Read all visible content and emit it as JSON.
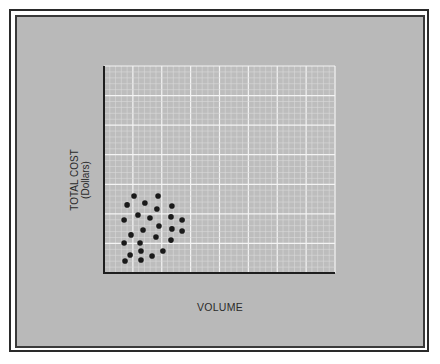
{
  "chart_data": {
    "type": "scatter",
    "title": "",
    "xlabel": "VOLUME",
    "ylabel": "TOTAL COST",
    "ylabel_sub": "(Dollars)",
    "xlim": [
      0,
      100
    ],
    "ylim": [
      0,
      100
    ],
    "grid": true,
    "ticks_labeled": false,
    "legend": "none",
    "marker_color": "#1a1a1a",
    "series": [
      {
        "name": "observations",
        "points": [
          {
            "x": 13.0,
            "y": 37.2
          },
          {
            "x": 23.4,
            "y": 37.2
          },
          {
            "x": 10.0,
            "y": 32.9
          },
          {
            "x": 17.7,
            "y": 33.8
          },
          {
            "x": 22.9,
            "y": 30.9
          },
          {
            "x": 29.4,
            "y": 32.4
          },
          {
            "x": 14.7,
            "y": 28.0
          },
          {
            "x": 19.9,
            "y": 26.6
          },
          {
            "x": 29.0,
            "y": 27.1
          },
          {
            "x": 8.7,
            "y": 25.6
          },
          {
            "x": 33.8,
            "y": 25.6
          },
          {
            "x": 23.8,
            "y": 22.7
          },
          {
            "x": 16.9,
            "y": 20.8
          },
          {
            "x": 29.4,
            "y": 21.3
          },
          {
            "x": 33.8,
            "y": 20.3
          },
          {
            "x": 11.7,
            "y": 18.4
          },
          {
            "x": 22.5,
            "y": 17.4
          },
          {
            "x": 29.0,
            "y": 15.9
          },
          {
            "x": 8.7,
            "y": 14.5
          },
          {
            "x": 15.6,
            "y": 14.5
          },
          {
            "x": 16.0,
            "y": 10.6
          },
          {
            "x": 25.5,
            "y": 10.6
          },
          {
            "x": 11.3,
            "y": 8.7
          },
          {
            "x": 20.8,
            "y": 8.2
          },
          {
            "x": 16.0,
            "y": 6.3
          },
          {
            "x": 9.1,
            "y": 5.8
          }
        ]
      }
    ]
  }
}
